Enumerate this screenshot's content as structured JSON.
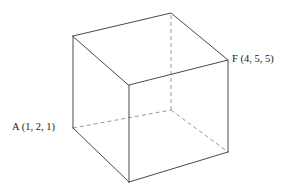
{
  "figure": {
    "type": "3d-cube-diagram",
    "background_color": "#ffffff",
    "solid_edge_color": "#4a4a4a",
    "dashed_edge_color": "#9a9a9a",
    "label_color": "#1a1a1a"
  },
  "labels": {
    "a": "A (1, 2, 1)",
    "f": "F (4, 5, 5)"
  },
  "vertices": {
    "top_left": {
      "name": "top-left",
      "x": 73,
      "y": 36,
      "hidden": false
    },
    "top_back_apex": {
      "name": "top-back-apex",
      "x": 171,
      "y": 13,
      "hidden": false
    },
    "top_right_f": {
      "name": "top-right-F",
      "x": 228,
      "y": 60,
      "hidden": false
    },
    "top_front": {
      "name": "top-front",
      "x": 129,
      "y": 85,
      "hidden": false
    },
    "bottom_left_a": {
      "name": "bottom-left-A",
      "x": 73,
      "y": 128,
      "hidden": false
    },
    "bottom_back": {
      "name": "bottom-back",
      "x": 171,
      "y": 110,
      "hidden": true
    },
    "bottom_right": {
      "name": "bottom-right",
      "x": 228,
      "y": 152,
      "hidden": false
    },
    "bottom_front": {
      "name": "bottom-front",
      "x": 129,
      "y": 182,
      "hidden": false
    }
  },
  "edges": {
    "solid": [
      {
        "id": "top-left--top-back-apex",
        "points": "73,36 171,13"
      },
      {
        "id": "top-back-apex--top-right-f",
        "points": "171,13 228,60"
      },
      {
        "id": "top-right-f--top-front",
        "points": "228,60 129,85"
      },
      {
        "id": "top-front--top-left",
        "points": "129,85 73,36"
      },
      {
        "id": "top-left--bottom-left-a",
        "points": "73,36 73,128"
      },
      {
        "id": "top-front--bottom-front",
        "points": "129,85 129,182"
      },
      {
        "id": "top-right-f--bottom-right",
        "points": "228,60 228,152"
      },
      {
        "id": "bottom-left-a--bottom-front",
        "points": "73,128 129,182"
      },
      {
        "id": "bottom-front--bottom-right",
        "points": "129,182 228,152"
      }
    ],
    "dashed": [
      {
        "id": "bottom-left-a--bottom-back",
        "points": "73,128 171,110"
      },
      {
        "id": "bottom-back--top-back-apex",
        "points": "171,110 171,13"
      },
      {
        "id": "bottom-back--bottom-right",
        "points": "171,110 228,152"
      }
    ]
  }
}
